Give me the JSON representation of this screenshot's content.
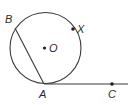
{
  "diagram": {
    "type": "geometry",
    "circle": {
      "center_label": "O",
      "cx": 45.5,
      "cy": 48,
      "r": 35.5
    },
    "points": {
      "A": {
        "label": "A",
        "x": 44,
        "y": 84
      },
      "B": {
        "label": "B",
        "x": 15,
        "y": 28
      },
      "X": {
        "label": "X",
        "x": 73,
        "y": 29
      },
      "C": {
        "label": "C",
        "x": 112,
        "y": 84
      },
      "O": {
        "label": "O",
        "x": 44.5,
        "y": 48
      }
    },
    "segments": [
      {
        "name": "chord-BA",
        "from": "B",
        "to": "A"
      },
      {
        "name": "ray-AC",
        "from": "A",
        "to": "C",
        "extends_to_x": 128
      }
    ],
    "colors": {
      "stroke": "#3a3a3a",
      "point": "#1e1e1e",
      "background": "#ffffff"
    }
  }
}
